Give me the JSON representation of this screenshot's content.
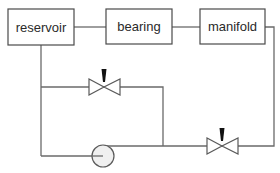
{
  "diagram": {
    "type": "hydraulic-schematic",
    "components": {
      "reservoir": {
        "label": "reservoir",
        "kind": "block"
      },
      "bearing": {
        "label": "bearing",
        "kind": "block"
      },
      "manifold": {
        "label": "manifold",
        "kind": "block"
      },
      "valve_upper": {
        "label": "",
        "kind": "valve"
      },
      "valve_lower": {
        "label": "",
        "kind": "valve"
      },
      "pump": {
        "label": "",
        "kind": "pump"
      }
    },
    "connections": [
      {
        "from": "reservoir",
        "to": "bearing"
      },
      {
        "from": "bearing",
        "to": "manifold"
      },
      {
        "from": "reservoir",
        "to": "valve_upper"
      },
      {
        "from": "valve_upper",
        "to": "valve_lower"
      },
      {
        "from": "reservoir",
        "to": "pump"
      },
      {
        "from": "pump",
        "to": "valve_lower"
      },
      {
        "from": "manifold",
        "to": "valve_lower"
      }
    ],
    "colors": {
      "line": "#6a6a6a",
      "box_border": "#4a4a4a",
      "text": "#2a2a2a",
      "valve_stem": "#111111",
      "pump_fill": "#f0f0f0",
      "background": "#ffffff"
    }
  }
}
